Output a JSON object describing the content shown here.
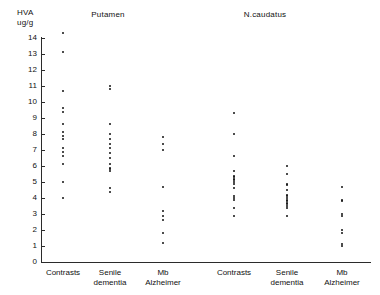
{
  "chart_data": {
    "type": "scatter",
    "title": "",
    "ylabel": "HVA\nug/g",
    "xlabel": "",
    "ylim": [
      0,
      14
    ],
    "ytick_labels": [
      "0",
      "1",
      "2",
      "3",
      "4",
      "5",
      "6",
      "7",
      "8",
      "9",
      "10",
      "11",
      "12",
      "13",
      "14"
    ],
    "grid": false,
    "legend": "none",
    "panels": [
      {
        "name": "Putamen",
        "groups": [
          {
            "label": "Contrasts",
            "label_lines": [
              "Contrasts"
            ],
            "values": [
              14.3,
              13.1,
              10.7,
              9.6,
              9.4,
              8.6,
              8.1,
              7.9,
              7.7,
              7.1,
              6.9,
              6.6,
              6.1,
              5.0,
              4.0
            ]
          },
          {
            "label": "Senile dementia",
            "label_lines": [
              "Senile",
              "dementia"
            ],
            "values": [
              11.0,
              10.8,
              8.6,
              8.0,
              7.7,
              7.4,
              7.1,
              6.8,
              6.5,
              6.1,
              5.9,
              5.8,
              5.7,
              4.6,
              4.4
            ]
          },
          {
            "label": "Mb Alzheimer",
            "label_lines": [
              "Mb",
              "Alzheimer"
            ],
            "values": [
              7.8,
              7.4,
              7.0,
              4.7,
              3.2,
              2.9,
              2.6,
              1.8,
              1.2
            ]
          }
        ]
      },
      {
        "name": "N.caudatus",
        "groups": [
          {
            "label": "Contrasts",
            "label_lines": [
              "Contrasts"
            ],
            "values": [
              9.3,
              8.0,
              6.6,
              5.7,
              5.4,
              5.3,
              5.2,
              5.1,
              5.0,
              4.9,
              4.6,
              4.1,
              4.0,
              3.9,
              3.4,
              2.9
            ]
          },
          {
            "label": "Senile dementia",
            "label_lines": [
              "Senile",
              "dementia"
            ],
            "values": [
              6.0,
              5.5,
              4.9,
              4.8,
              4.5,
              4.2,
              4.1,
              4.0,
              3.9,
              3.8,
              3.7,
              3.6,
              3.5,
              3.4,
              2.9
            ]
          },
          {
            "label": "Mb Alzheimer",
            "label_lines": [
              "Mb",
              "Alzheimer"
            ],
            "values": [
              4.7,
              3.9,
              3.8,
              3.0,
              2.9,
              2.0,
              1.8,
              1.1,
              1.0
            ]
          }
        ]
      }
    ]
  },
  "axis": {
    "y_title": "HVA\nug/g"
  },
  "colors": {
    "axis": "#2b2b2b",
    "point": "#111111",
    "text": "#111111",
    "background": "#ffffff"
  }
}
